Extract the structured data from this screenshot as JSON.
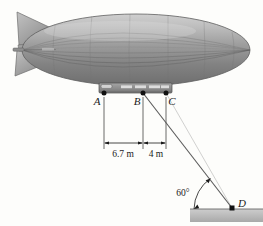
{
  "figure": {
    "background_color": "#fdfdfb",
    "ink_color": "#1a1a1a"
  },
  "blimp": {
    "name": "airship-envelope",
    "body_fill_light": "#d8d8d8",
    "body_fill_mid": "#a8a8a8",
    "body_fill_dark": "#6f6f6f",
    "seam_color": "#7d7d7d",
    "tail_fin_fill": "#9a9a9a",
    "nose_probe_fill": "#8a8a8a"
  },
  "gondola": {
    "name": "gondola",
    "fill": "#8e8e8e",
    "stroke": "#4a4a4a",
    "window_fill": "#dcdcdc",
    "window_count": 4,
    "cockpit_fill": "#cfcfcf"
  },
  "points": [
    {
      "id": "A",
      "label": "A",
      "x": 104,
      "y": 93,
      "label_x": 97,
      "label_y": 104
    },
    {
      "id": "B",
      "label": "B",
      "x": 143,
      "y": 93,
      "label_x": 136,
      "label_y": 104
    },
    {
      "id": "C",
      "label": "C",
      "x": 166,
      "y": 93,
      "label_x": 169,
      "label_y": 104
    },
    {
      "id": "D",
      "label": "D",
      "x": 232,
      "y": 208,
      "label_x": 238,
      "label_y": 207
    }
  ],
  "dimensions": [
    {
      "name": "dim-a-b",
      "label": "6.7 m",
      "from": "A",
      "to": "B",
      "x1": 104,
      "x2": 143,
      "y": 143,
      "text_x": 123,
      "text_y": 157
    },
    {
      "name": "dim-b-c",
      "label": "4 m",
      "from": "B",
      "to": "C",
      "x1": 143,
      "x2": 166,
      "y": 143,
      "text_x": 155,
      "text_y": 157
    }
  ],
  "angle": {
    "name": "cable-ground-angle",
    "label": "60°",
    "value": 60,
    "unit": "degrees",
    "text_x": 183,
    "text_y": 196,
    "vertex": "D"
  },
  "cable": {
    "name": "mooring-cable",
    "from": "B",
    "to": "D",
    "color": "#5a5a5a"
  },
  "ground": {
    "name": "ground-surface",
    "fill_top": "#c9c9c9",
    "fill_bottom": "#b0b0b0",
    "edge": "#6a6a6a",
    "x": 190,
    "y": 209,
    "width": 73,
    "height": 13
  },
  "extension_lines": {
    "name": "extension-lines",
    "color": "#3a3a3a"
  }
}
